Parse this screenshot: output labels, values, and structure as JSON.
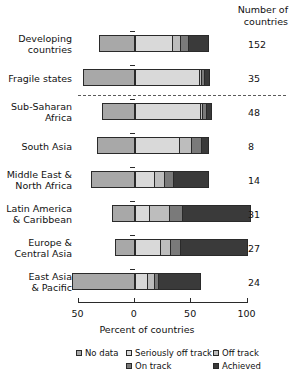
{
  "header": {
    "count_line1": "Number of",
    "count_line2": "countries"
  },
  "axis": {
    "title": "Percent of countries",
    "ticks": [
      {
        "value": -50,
        "label": "50"
      },
      {
        "value": 0,
        "label": "0"
      },
      {
        "value": 50,
        "label": "50"
      },
      {
        "value": 100,
        "label": "100"
      }
    ],
    "min": -50,
    "max": 100
  },
  "legend": {
    "items": [
      {
        "label": "No data",
        "color": "#a8a8a8"
      },
      {
        "label": "Seriously off track",
        "color": "#d9d9d9"
      },
      {
        "label": "Off track",
        "color": "#bdbdbd"
      },
      {
        "label": "On track",
        "color": "#7a7a7a"
      },
      {
        "label": "Achieved",
        "color": "#3a3a3a"
      }
    ]
  },
  "chart_data": {
    "type": "bar",
    "orientation": "horizontal",
    "stacked": true,
    "title": "",
    "xlabel": "Percent of countries",
    "ylabel": "",
    "xlim": [
      -50,
      100
    ],
    "grid": false,
    "legend_position": "bottom",
    "zero_reference": 0,
    "series": [
      {
        "name": "No data",
        "color": "#a8a8a8"
      },
      {
        "name": "Seriously off track",
        "color": "#d9d9d9"
      },
      {
        "name": "Off track",
        "color": "#bdbdbd"
      },
      {
        "name": "On track",
        "color": "#7a7a7a"
      },
      {
        "name": "Achieved",
        "color": "#3a3a3a"
      }
    ],
    "categories": [
      {
        "label_line1": "Developing",
        "label_line2": "countries",
        "count": "152",
        "no_data": 31,
        "seriously_off_track": 33,
        "off_track": 7,
        "on_track": 7,
        "achieved": 20
      },
      {
        "label_line1": "Fragile states",
        "label_line2": "",
        "count": "35",
        "no_data": 45,
        "seriously_off_track": 57,
        "off_track": 2,
        "on_track": 2,
        "achieved": 7
      },
      {
        "label_line1": "Sub-Saharan",
        "label_line2": "Africa",
        "count": "48",
        "no_data": 28,
        "seriously_off_track": 58,
        "off_track": 2,
        "on_track": 3,
        "achieved": 6
      },
      {
        "label_line1": "South Asia",
        "label_line2": "",
        "count": "8",
        "no_data": 33,
        "seriously_off_track": 39,
        "off_track": 11,
        "on_track": 9,
        "achieved": 8
      },
      {
        "label_line1": "Middle East &",
        "label_line2": "North Africa",
        "count": "14",
        "no_data": 38,
        "seriously_off_track": 17,
        "off_track": 9,
        "on_track": 8,
        "achieved": 33
      },
      {
        "label_line1": "Latin America",
        "label_line2": "& Caribbean",
        "count": "31",
        "no_data": 19,
        "seriously_off_track": 13,
        "off_track": 17,
        "on_track": 12,
        "achieved": 62
      },
      {
        "label_line1": "Europe &",
        "label_line2": "Central Asia",
        "count": "27",
        "no_data": 17,
        "seriously_off_track": 22,
        "off_track": 9,
        "on_track": 9,
        "achieved": 61
      },
      {
        "label_line1": "East Asia",
        "label_line2": "& Pacific",
        "count": "24",
        "no_data": 55,
        "seriously_off_track": 11,
        "off_track": 6,
        "on_track": 4,
        "achieved": 39
      }
    ]
  }
}
